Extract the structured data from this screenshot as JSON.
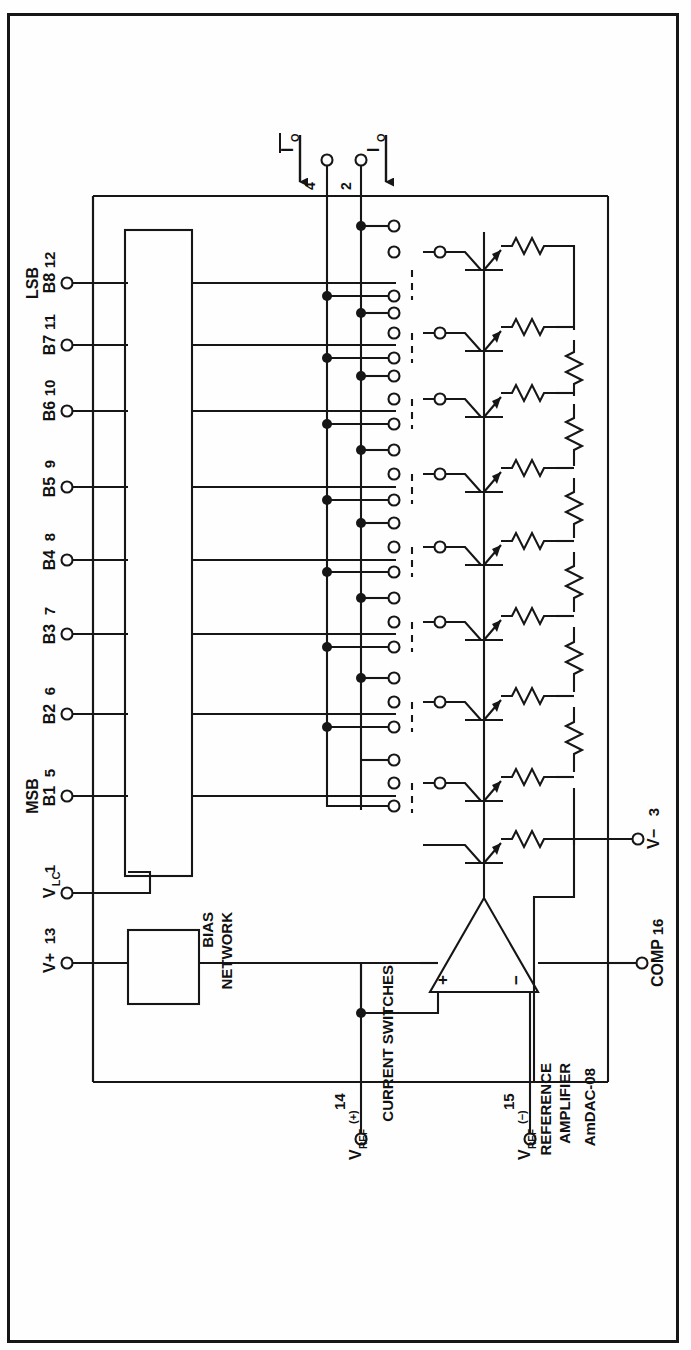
{
  "document": {
    "type": "schematic-diagram",
    "device_name": "AmDAC-08",
    "orientation": "rotated-90-ccw"
  },
  "blocks": {
    "bias_network": "BIAS\nNETWORK",
    "bias_network_line1": "BIAS",
    "bias_network_line2": "NETWORK",
    "current_switches": "CURRENT SWITCHES",
    "reference_amplifier_line1": "REFERENCE",
    "reference_amplifier_line2": "AMPLIFIER",
    "device_label": "AmDAC-08"
  },
  "amplifier": {
    "plus_label": "+",
    "minus_label": "−"
  },
  "outputs": [
    {
      "name": "io-bar-output",
      "label": "I",
      "sub": "O",
      "overbar": true,
      "pin": "4"
    },
    {
      "name": "io-output",
      "label": "I",
      "sub": "O",
      "overbar": false,
      "pin": "2"
    }
  ],
  "digital_inputs": [
    {
      "name": "lsb-b8",
      "group": "LSB",
      "label": "B8",
      "pin": "12"
    },
    {
      "name": "b7",
      "group": "",
      "label": "B7",
      "pin": "11"
    },
    {
      "name": "b6",
      "group": "",
      "label": "B6",
      "pin": "10"
    },
    {
      "name": "b5",
      "group": "",
      "label": "B5",
      "pin": "9"
    },
    {
      "name": "b4",
      "group": "",
      "label": "B4",
      "pin": "8"
    },
    {
      "name": "b3",
      "group": "",
      "label": "B3",
      "pin": "7"
    },
    {
      "name": "b2",
      "group": "",
      "label": "B2",
      "pin": "6"
    },
    {
      "name": "msb-b1",
      "group": "MSB",
      "label": "B1",
      "pin": "5"
    }
  ],
  "power_pins": [
    {
      "name": "vlc",
      "label": "VLC",
      "base": "V",
      "sub": "LC",
      "pin": "1"
    },
    {
      "name": "v-plus",
      "label": "V+",
      "base": "V+",
      "sub": "",
      "pin": "13"
    },
    {
      "name": "v-minus",
      "label": "V−",
      "base": "V−",
      "sub": "",
      "pin": "3"
    },
    {
      "name": "comp",
      "label": "COMP",
      "base": "COMP",
      "sub": "",
      "pin": "16"
    }
  ],
  "reference_pins": [
    {
      "name": "vref-plus",
      "base": "V",
      "sub": "REF",
      "sup": "(+)",
      "pin": "14"
    },
    {
      "name": "vref-minus",
      "base": "V",
      "sub": "REF",
      "sup": "(−)",
      "pin": "15"
    }
  ],
  "colors": {
    "ink": "#161616",
    "paper": "#fefefe",
    "line": "#1a1a1a"
  },
  "counts": {
    "bit_count": 8,
    "switch_cells": 8,
    "ladder_resistors": 8
  }
}
